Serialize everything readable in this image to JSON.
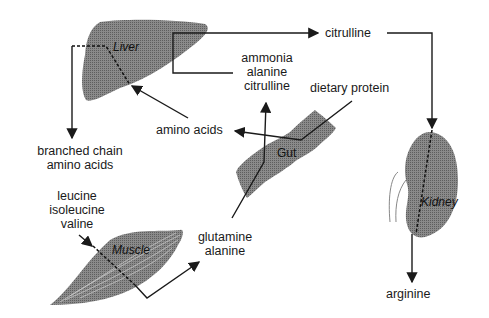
{
  "diagram": {
    "organs": {
      "liver": "Liver",
      "gut": "Gut",
      "kidney": "Kidney",
      "muscle": "Muscle"
    },
    "labels": {
      "citrulline_top": "citrulline",
      "liver_outputs": [
        "ammonia",
        "alanine",
        "citrulline"
      ],
      "dietary_protein": "dietary protein",
      "amino_acids": "amino acids",
      "bcaa": [
        "branched chain",
        "amino acids"
      ],
      "muscle_inputs": [
        "leucine",
        "isoleucine",
        "valine"
      ],
      "muscle_outputs": [
        "glutamine",
        "alanine"
      ],
      "arginine": "arginine"
    },
    "colors": {
      "organ_fill": "#7a7a7a",
      "line": "#1a1a1a",
      "background": "#ffffff"
    }
  }
}
